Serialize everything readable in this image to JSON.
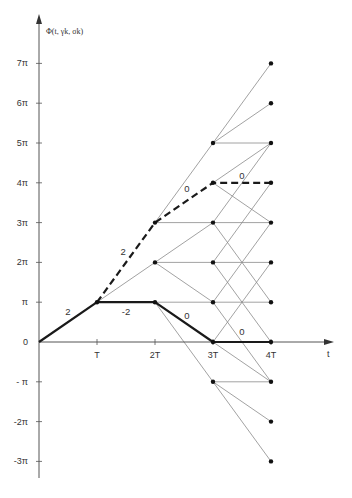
{
  "title": "Φ(t, γk, σk)",
  "axis": {
    "y_label": "Φ(t, γk, σk)",
    "x_label": "t",
    "y_ticks": [
      {
        "value": 7,
        "label": "7π"
      },
      {
        "value": 6,
        "label": "6π"
      },
      {
        "value": 5,
        "label": "5π"
      },
      {
        "value": 4,
        "label": "4π"
      },
      {
        "value": 3,
        "label": "3π"
      },
      {
        "value": 2,
        "label": "2π"
      },
      {
        "value": 1,
        "label": "π"
      },
      {
        "value": 0,
        "label": "0"
      },
      {
        "value": -1,
        "label": "- π"
      },
      {
        "value": -2,
        "label": "-2π"
      },
      {
        "value": -3,
        "label": "-3π"
      }
    ],
    "x_ticks": [
      {
        "value": 1,
        "label": "T"
      },
      {
        "value": 2,
        "label": "2T"
      },
      {
        "value": 3,
        "label": "3T"
      },
      {
        "value": 4,
        "label": "4T"
      }
    ]
  },
  "nodes": {
    "1": [
      1
    ],
    "2": [
      3,
      2,
      1
    ],
    "3": [
      5,
      4,
      3,
      2,
      1,
      0,
      -1
    ],
    "4": [
      7,
      6,
      5,
      4,
      3,
      2,
      1,
      0,
      -1,
      -2,
      -3
    ]
  },
  "thin_edges": [
    [
      [
        2,
        3
      ],
      [
        3,
        5
      ]
    ],
    [
      [
        3,
        5
      ],
      [
        4,
        7
      ]
    ],
    [
      [
        3,
        5
      ],
      [
        4,
        6
      ]
    ],
    [
      [
        3,
        5
      ],
      [
        4,
        5
      ]
    ],
    [
      [
        1,
        1
      ],
      [
        2,
        2
      ]
    ],
    [
      [
        2,
        3
      ],
      [
        3,
        3
      ]
    ],
    [
      [
        2,
        2
      ],
      [
        3,
        3
      ]
    ],
    [
      [
        2,
        2
      ],
      [
        3,
        2
      ]
    ],
    [
      [
        2,
        2
      ],
      [
        3,
        1
      ]
    ],
    [
      [
        2,
        1
      ],
      [
        3,
        1
      ]
    ],
    [
      [
        2,
        1
      ],
      [
        3,
        -1
      ]
    ],
    [
      [
        3,
        4
      ],
      [
        4,
        5
      ]
    ],
    [
      [
        3,
        4
      ],
      [
        4,
        3
      ]
    ],
    [
      [
        3,
        3
      ],
      [
        4,
        5
      ]
    ],
    [
      [
        3,
        3
      ],
      [
        4,
        3
      ]
    ],
    [
      [
        3,
        3
      ],
      [
        4,
        1
      ]
    ],
    [
      [
        3,
        2
      ],
      [
        4,
        4
      ]
    ],
    [
      [
        3,
        2
      ],
      [
        4,
        2
      ]
    ],
    [
      [
        3,
        2
      ],
      [
        4,
        0
      ]
    ],
    [
      [
        3,
        1
      ],
      [
        4,
        3
      ]
    ],
    [
      [
        3,
        1
      ],
      [
        4,
        1
      ]
    ],
    [
      [
        3,
        1
      ],
      [
        4,
        -1
      ]
    ],
    [
      [
        3,
        0
      ],
      [
        4,
        2
      ]
    ],
    [
      [
        3,
        0
      ],
      [
        4,
        -1
      ]
    ],
    [
      [
        3,
        -1
      ],
      [
        4,
        -1
      ]
    ],
    [
      [
        3,
        -1
      ],
      [
        4,
        -2
      ]
    ],
    [
      [
        3,
        -1
      ],
      [
        4,
        -3
      ]
    ]
  ],
  "solid_path": {
    "style": "thick",
    "points": [
      [
        0,
        0
      ],
      [
        1,
        1
      ],
      [
        2,
        1
      ],
      [
        3,
        0
      ],
      [
        4,
        0
      ]
    ],
    "labels": [
      {
        "text": "2",
        "at": [
          0.5,
          0.75
        ]
      },
      {
        "text": "-2",
        "at": [
          1.5,
          0.75
        ]
      },
      {
        "text": "0",
        "at": [
          2.55,
          0.65
        ]
      },
      {
        "text": "0",
        "at": [
          3.5,
          0.25
        ]
      }
    ]
  },
  "dashed_path": {
    "style": "thick-dashed",
    "points": [
      [
        1,
        1
      ],
      [
        2,
        3
      ],
      [
        3,
        4
      ],
      [
        4,
        4
      ]
    ],
    "labels": [
      {
        "text": "2",
        "at": [
          1.45,
          2.25
        ]
      },
      {
        "text": "0",
        "at": [
          2.55,
          3.85
        ]
      },
      {
        "text": "0",
        "at": [
          3.5,
          4.18
        ]
      }
    ]
  },
  "colors": {
    "thin": "#8a8a8a",
    "thick": "#1a1a1a",
    "axis": "#555555",
    "node": "#111111"
  }
}
